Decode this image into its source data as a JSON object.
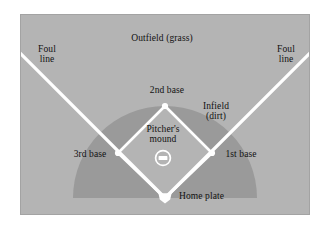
{
  "figure": {
    "kind": "baseball-field-diagram",
    "canvas": {
      "width": 324,
      "height": 228
    }
  },
  "colors": {
    "page_background": "#ffffff",
    "grass": "#b4b4b4",
    "dirt": "#9a9a9a",
    "lines": "#ffffff",
    "text": "#111111",
    "field_border": "#a8a8a8"
  },
  "labels": {
    "outfield": "Outfield (grass)",
    "foul_line_left": "Foul\nline",
    "foul_line_right": "Foul\nline",
    "second_base": "2nd base",
    "infield": "Infield\n(dirt)",
    "pitchers_mound": "Pitcher's\nmound",
    "third_base": "3rd base",
    "first_base": "1st base",
    "home_plate": "Home plate"
  },
  "geometry": {
    "field_rect": {
      "x": 20,
      "y": 14,
      "width": 290,
      "height": 201
    },
    "home_plate": {
      "x": 165,
      "y": 198
    },
    "first_base": {
      "x": 212,
      "y": 153
    },
    "second_base": {
      "x": 165,
      "y": 106
    },
    "third_base": {
      "x": 118,
      "y": 153
    },
    "pitchers_mound": {
      "x": 163,
      "y": 158,
      "radius": 8
    },
    "pitchers_rubber": {
      "width": 9,
      "height": 4
    },
    "foul_line_left_end": {
      "x": 18,
      "y": 57
    },
    "foul_line_right_end": {
      "x": 311,
      "y": 57
    },
    "infield_arc_radius": 92,
    "line_width": 3
  },
  "features": [
    {
      "name": "outfield",
      "type": "region",
      "surface": "grass"
    },
    {
      "name": "infield",
      "type": "region",
      "surface": "dirt"
    },
    {
      "name": "foul-line-left",
      "type": "line"
    },
    {
      "name": "foul-line-right",
      "type": "line"
    },
    {
      "name": "base-path-diamond",
      "type": "line"
    },
    {
      "name": "first-base",
      "type": "marker"
    },
    {
      "name": "second-base",
      "type": "marker"
    },
    {
      "name": "third-base",
      "type": "marker"
    },
    {
      "name": "home-plate",
      "type": "marker"
    },
    {
      "name": "pitchers-mound",
      "type": "marker"
    }
  ]
}
